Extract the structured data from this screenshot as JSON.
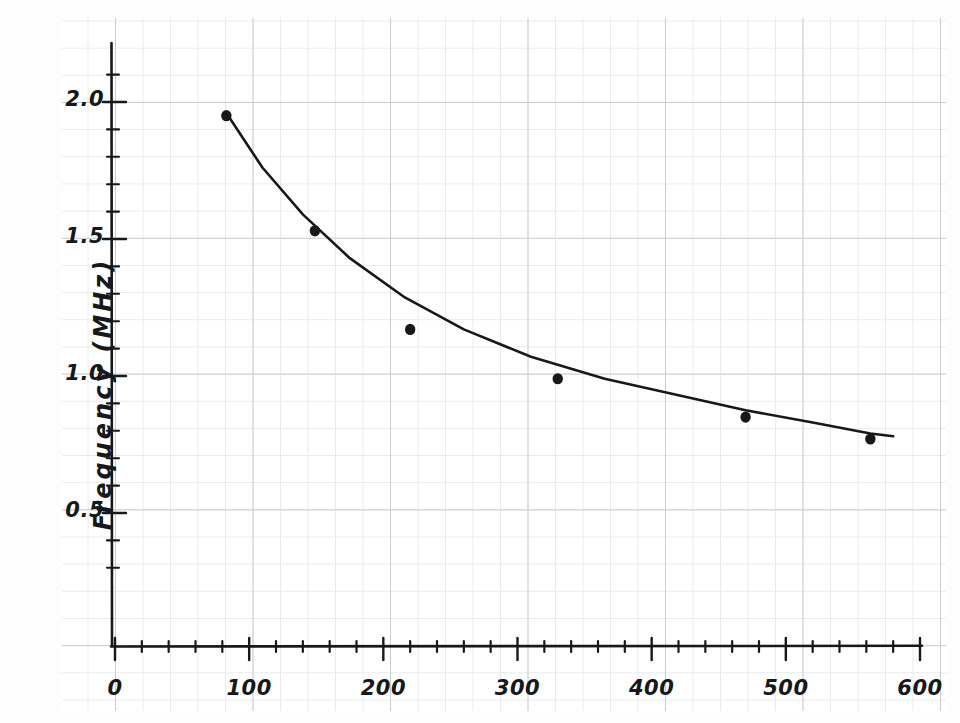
{
  "chart_data": {
    "type": "scatter",
    "title": "",
    "xlabel": "",
    "ylabel": "Frequency  (MHz)",
    "style": "hand-drawn graph paper",
    "xlim": [
      0,
      620
    ],
    "ylim": [
      0,
      2.2
    ],
    "grid": true,
    "legend": null,
    "x_ticks": [
      {
        "value": 0,
        "label": "0"
      },
      {
        "value": 100,
        "label": "100"
      },
      {
        "value": 200,
        "label": "200"
      },
      {
        "value": 300,
        "label": "300"
      },
      {
        "value": 400,
        "label": "400"
      },
      {
        "value": 500,
        "label": "500"
      },
      {
        "value": 600,
        "label": "600"
      }
    ],
    "x_minor_ticks": [
      20,
      40,
      60,
      80,
      120,
      140,
      160,
      180,
      220,
      240,
      260,
      280,
      320,
      340,
      360,
      380,
      420,
      440,
      460,
      480,
      520,
      540,
      560,
      580
    ],
    "y_ticks": [
      {
        "value": 0.5,
        "label": "0.5"
      },
      {
        "value": 1.0,
        "label": "1.0"
      },
      {
        "value": 1.5,
        "label": "1.5"
      },
      {
        "value": 2.0,
        "label": "2.0"
      }
    ],
    "y_minor_ticks": [
      0.3,
      0.4,
      0.6,
      0.7,
      0.8,
      0.9,
      1.1,
      1.2,
      1.3,
      1.4,
      1.6,
      1.7,
      1.8,
      1.9,
      2.1
    ],
    "points": [
      {
        "x": 83,
        "y": 1.95
      },
      {
        "x": 149,
        "y": 1.53
      },
      {
        "x": 220,
        "y": 1.17
      },
      {
        "x": 330,
        "y": 0.99
      },
      {
        "x": 470,
        "y": 0.85
      },
      {
        "x": 563,
        "y": 0.77
      }
    ],
    "fit_curve": {
      "name": "smooth decaying fit",
      "x": [
        83,
        110,
        140,
        175,
        215,
        260,
        310,
        365,
        420,
        470,
        520,
        563,
        580
      ],
      "y": [
        1.96,
        1.76,
        1.59,
        1.43,
        1.29,
        1.17,
        1.07,
        0.99,
        0.93,
        0.875,
        0.83,
        0.79,
        0.78
      ]
    }
  },
  "colors": {
    "ink": "#16181a",
    "grid_major": "#c9cdd2",
    "grid_minor": "#e8eaec",
    "paper": "#ffffff"
  }
}
